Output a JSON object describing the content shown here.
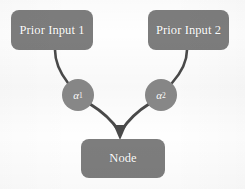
{
  "diagram": {
    "background_color": "#fefefe",
    "box_fill": "#7d7d7d",
    "circle_fill": "#898989",
    "edge_color": "#4a4a4a",
    "label_color": "#ffffff",
    "boxes": [
      {
        "id": "prior-input-1",
        "label": "Prior Input 1",
        "x": 11,
        "y": 10,
        "w": 82,
        "h": 40
      },
      {
        "id": "prior-input-2",
        "label": "Prior Input 2",
        "x": 148,
        "y": 10,
        "w": 81,
        "h": 40
      },
      {
        "id": "node",
        "label": "Node",
        "x": 81,
        "y": 139,
        "w": 84,
        "h": 39
      }
    ],
    "weights": [
      {
        "id": "alpha-1",
        "symbol": "α",
        "subscript": "1",
        "cx": 78,
        "cy": 95,
        "r": 16
      },
      {
        "id": "alpha-2",
        "symbol": "α",
        "subscript": "2",
        "cx": 161,
        "cy": 95,
        "r": 16
      }
    ],
    "edges": [
      {
        "id": "edge-input1-alpha1",
        "from": "prior-input-1",
        "to": "alpha-1",
        "arrow": false
      },
      {
        "id": "edge-input2-alpha2",
        "from": "prior-input-2",
        "to": "alpha-2",
        "arrow": false
      },
      {
        "id": "edge-alpha1-node",
        "from": "alpha-1",
        "to": "node",
        "arrow": true
      },
      {
        "id": "edge-alpha2-node",
        "from": "alpha-2",
        "to": "node",
        "arrow": true
      }
    ]
  }
}
